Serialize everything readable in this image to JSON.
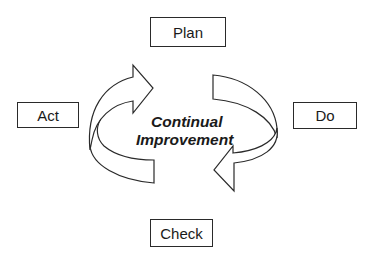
{
  "diagram": {
    "type": "cycle",
    "center_label": {
      "line1": "Continual",
      "line2": "Improvement"
    },
    "stages": [
      {
        "id": "plan",
        "label": "Plan",
        "position": "top"
      },
      {
        "id": "do",
        "label": "Do",
        "position": "right"
      },
      {
        "id": "check",
        "label": "Check",
        "position": "bottom"
      },
      {
        "id": "act",
        "label": "Act",
        "position": "left"
      }
    ],
    "arrows": [
      {
        "name": "act-to-plan-arrow",
        "direction": "clockwise",
        "side": "left"
      },
      {
        "name": "do-to-check-arrow",
        "direction": "clockwise",
        "side": "right"
      }
    ],
    "colors": {
      "stroke": "#2a2a2a",
      "text": "#1a1a1a",
      "background": "#ffffff"
    }
  }
}
